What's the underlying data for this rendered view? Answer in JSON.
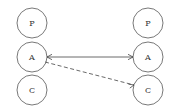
{
  "canvas": {
    "width": 180,
    "height": 112,
    "background": "#ffffff",
    "stroke_color": "#555555",
    "edge_color": "#444444",
    "label_color": "#333333"
  },
  "diagram": {
    "type": "node-link-diagram",
    "columns": [
      {
        "name": "left-column",
        "cx": 32,
        "nodes": [
          {
            "id": "left-p",
            "label": "P",
            "cx": 32,
            "cy": 23,
            "r": 15
          },
          {
            "id": "left-a",
            "label": "A",
            "cx": 32,
            "cy": 57,
            "r": 15
          },
          {
            "id": "left-c",
            "label": "C",
            "cx": 32,
            "cy": 90,
            "r": 15
          }
        ]
      },
      {
        "name": "right-column",
        "cx": 148,
        "nodes": [
          {
            "id": "right-p",
            "label": "P",
            "cx": 148,
            "cy": 23,
            "r": 15
          },
          {
            "id": "right-a",
            "label": "A",
            "cx": 148,
            "cy": 57,
            "r": 15
          },
          {
            "id": "right-c",
            "label": "C",
            "cx": 148,
            "cy": 90,
            "r": 15
          }
        ]
      }
    ],
    "edges": [
      {
        "id": "edge-a-to-a",
        "style": "solid",
        "from": "left-a",
        "to": "right-a",
        "arrow": "both",
        "x1": 47,
        "y1": 57,
        "x2": 133,
        "y2": 57
      },
      {
        "id": "edge-a-to-c",
        "style": "dashed",
        "from": "left-a",
        "to": "right-c",
        "arrow": "end",
        "x1": 45,
        "y1": 62,
        "x2": 134,
        "y2": 85
      }
    ]
  }
}
